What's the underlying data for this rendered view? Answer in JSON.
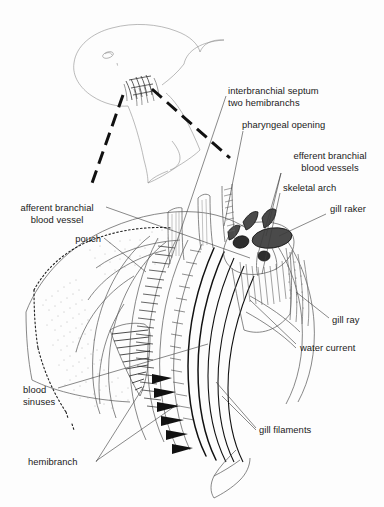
{
  "figure": {
    "background_color": "#fdfdfd",
    "ink_color": "#1a1a1a"
  },
  "labels": [
    {
      "id": "interbranchial-septum",
      "line1": "interbranchial septum",
      "line2": "two hemibranchs"
    },
    {
      "id": "pharyngeal-opening",
      "text": "pharyngeal opening"
    },
    {
      "id": "efferent-branchial-blood-vessels",
      "line1": "efferent branchial",
      "line2": "blood vessels"
    },
    {
      "id": "skeletal-arch",
      "text": "skeletal arch"
    },
    {
      "id": "gill-raker",
      "text": "gill raker"
    },
    {
      "id": "afferent-branchial-blood-vessel",
      "line1": "afferent branchial",
      "line2": "blood vessel"
    },
    {
      "id": "pouch",
      "text": "pouch"
    },
    {
      "id": "gill-ray",
      "text": "gill ray"
    },
    {
      "id": "water-current",
      "text": "water current"
    },
    {
      "id": "blood-sinuses",
      "line1": "blood",
      "line2": "sinuses"
    },
    {
      "id": "gill-filaments",
      "text": "gill filaments"
    },
    {
      "id": "hemibranch",
      "text": "hemibranch"
    }
  ]
}
